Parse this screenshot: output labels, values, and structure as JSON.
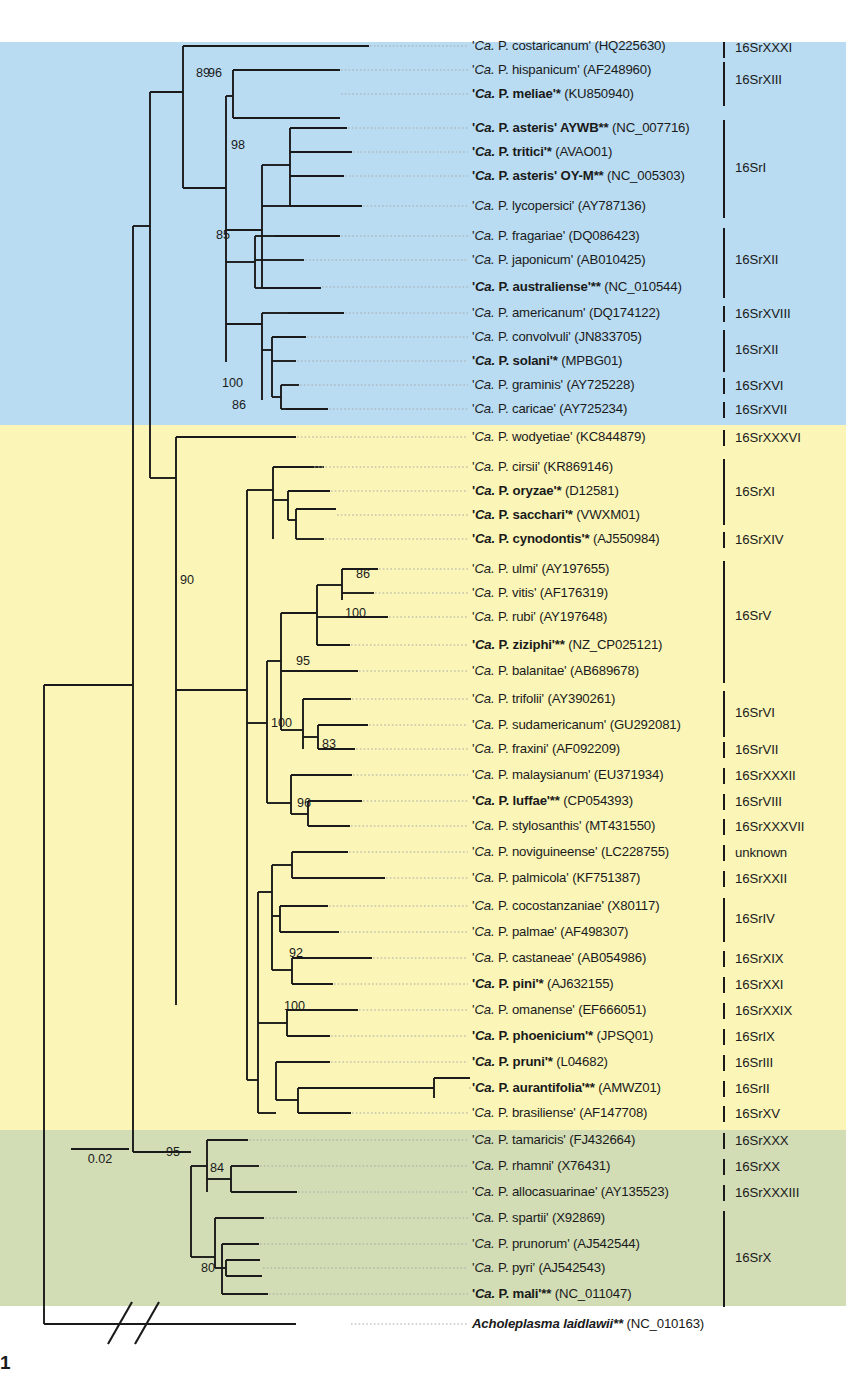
{
  "figure": {
    "number": "1",
    "scale_bar": {
      "value": "0.02",
      "label_position": "below"
    }
  },
  "clades": [
    {
      "name": "clade-blue",
      "color": "#b9dcf2",
      "top": 42,
      "height": 383
    },
    {
      "name": "clade-yellow",
      "color": "#fbf6b8",
      "top": 425,
      "height": 705
    },
    {
      "name": "clade-green",
      "color": "#d2ddb6",
      "top": 1130,
      "height": 176
    }
  ],
  "taxa": [
    {
      "name": "'Ca. P. costaricanum'",
      "accession": "(HQ225630)",
      "bold": false,
      "y": 46
    },
    {
      "name": "'Ca. P. hispanicum'",
      "accession": "(AF248960)",
      "bold": false,
      "y": 70
    },
    {
      "name": "'Ca. P. meliae'*",
      "accession": "(KU850940)",
      "bold": true,
      "y": 94
    },
    {
      "name": "'Ca. P. asteris' AYWB**",
      "accession": "(NC_007716)",
      "bold": true,
      "y": 128
    },
    {
      "name": "'Ca. P. tritici'*",
      "accession": "(AVAO01)",
      "bold": true,
      "y": 152
    },
    {
      "name": "'Ca. P. asteris' OY-M**",
      "accession": "(NC_005303)",
      "bold": true,
      "y": 176
    },
    {
      "name": "'Ca. P. lycopersici'",
      "accession": "(AY787136)",
      "bold": false,
      "y": 206
    },
    {
      "name": "'Ca. P. fragariae'",
      "accession": "(DQ086423)",
      "bold": false,
      "y": 236
    },
    {
      "name": "'Ca. P. japonicum'",
      "accession": "(AB010425)",
      "bold": false,
      "y": 260
    },
    {
      "name": "'Ca. P. australiense'**",
      "accession": "(NC_010544)",
      "bold": true,
      "y": 287
    },
    {
      "name": "'Ca. P. americanum'",
      "accession": "(DQ174122)",
      "bold": false,
      "y": 313
    },
    {
      "name": "'Ca. P. convolvuli'",
      "accession": "(JN833705)",
      "bold": false,
      "y": 337
    },
    {
      "name": "'Ca. P. solani'*",
      "accession": "(MPBG01)",
      "bold": true,
      "y": 361
    },
    {
      "name": "'Ca. P. graminis'",
      "accession": "(AY725228)",
      "bold": false,
      "y": 385
    },
    {
      "name": "'Ca. P. caricae'",
      "accession": "(AY725234)",
      "bold": false,
      "y": 409
    },
    {
      "name": "'Ca. P. wodyetiae'",
      "accession": "(KC844879)",
      "bold": false,
      "y": 437
    },
    {
      "name": "'Ca. P. cirsii'",
      "accession": "(KR869146)",
      "bold": false,
      "y": 467
    },
    {
      "name": "'Ca. P. oryzae'*",
      "accession": "(D12581)",
      "bold": true,
      "y": 491
    },
    {
      "name": "'Ca. P. sacchari'*",
      "accession": "(VWXM01)",
      "bold": true,
      "y": 515
    },
    {
      "name": "'Ca. P. cynodontis'*",
      "accession": "(AJ550984)",
      "bold": true,
      "y": 539
    },
    {
      "name": "'Ca. P. ulmi'",
      "accession": "(AY197655)",
      "bold": false,
      "y": 569
    },
    {
      "name": "'Ca. P. vitis'",
      "accession": "(AF176319)",
      "bold": false,
      "y": 593
    },
    {
      "name": "'Ca. P. rubi'",
      "accession": "(AY197648)",
      "bold": false,
      "y": 617
    },
    {
      "name": "'Ca. P. ziziphi'**",
      "accession": "(NZ_CP025121)",
      "bold": true,
      "y": 645
    },
    {
      "name": "'Ca. P. balanitae'",
      "accession": "(AB689678)",
      "bold": false,
      "y": 671
    },
    {
      "name": "'Ca. P. trifolii'",
      "accession": "(AY390261)",
      "bold": false,
      "y": 699
    },
    {
      "name": "'Ca. P. sudamericanum'",
      "accession": "(GU292081)",
      "bold": false,
      "y": 725
    },
    {
      "name": "'Ca. P. fraxini'",
      "accession": "(AF092209)",
      "bold": false,
      "y": 749
    },
    {
      "name": "'Ca. P. malaysianum'",
      "accession": "(EU371934)",
      "bold": false,
      "y": 775
    },
    {
      "name": "'Ca. P. luffae'**",
      "accession": "(CP054393)",
      "bold": true,
      "y": 801
    },
    {
      "name": "'Ca. P. stylosanthis'",
      "accession": "(MT431550)",
      "bold": false,
      "y": 826
    },
    {
      "name": "'Ca. P. noviguineense'",
      "accession": "(LC228755)",
      "bold": false,
      "y": 852
    },
    {
      "name": "'Ca. P. palmicola'",
      "accession": "(KF751387)",
      "bold": false,
      "y": 878
    },
    {
      "name": "'Ca. P. cocostanzaniae'",
      "accession": "(X80117)",
      "bold": false,
      "y": 906
    },
    {
      "name": "'Ca. P. palmae'",
      "accession": "(AF498307)",
      "bold": false,
      "y": 932
    },
    {
      "name": "'Ca. P. castaneae'",
      "accession": "(AB054986)",
      "bold": false,
      "y": 958
    },
    {
      "name": "'Ca. P. pini'*",
      "accession": "(AJ632155)",
      "bold": true,
      "y": 984
    },
    {
      "name": "'Ca. P. omanense'",
      "accession": "(EF666051)",
      "bold": false,
      "y": 1010
    },
    {
      "name": "'Ca. P. phoenicium'*",
      "accession": "(JPSQ01)",
      "bold": true,
      "y": 1036
    },
    {
      "name": "'Ca. P. pruni'*",
      "accession": "(L04682)",
      "bold": true,
      "y": 1062
    },
    {
      "name": "'Ca. P. aurantifolia'**",
      "accession": "(AMWZ01)",
      "bold": true,
      "y": 1088
    },
    {
      "name": "'Ca. P. brasiliense'",
      "accession": "(AF147708)",
      "bold": false,
      "y": 1113
    },
    {
      "name": "'Ca. P. tamaricis'",
      "accession": "(FJ432664)",
      "bold": false,
      "y": 1140
    },
    {
      "name": "'Ca. P. rhamni'",
      "accession": "(X76431)",
      "bold": false,
      "y": 1166
    },
    {
      "name": "'Ca. P. allocasuarinae'",
      "accession": "(AY135523)",
      "bold": false,
      "y": 1192
    },
    {
      "name": "'Ca. P. spartii'",
      "accession": "(X92869)",
      "bold": false,
      "y": 1218
    },
    {
      "name": "'Ca. P. prunorum'",
      "accession": "(AJ542544)",
      "bold": false,
      "y": 1244
    },
    {
      "name": "'Ca. P. pyri'",
      "accession": "(AJ542543)",
      "bold": false,
      "y": 1268
    },
    {
      "name": "'Ca. P. mali'**",
      "accession": "(NC_011047)",
      "bold": true,
      "y": 1294
    },
    {
      "name": "Acholeplasma laidlawii**",
      "accession": "(NC_010163)",
      "bold": true,
      "y": 1324,
      "outgroup": true
    }
  ],
  "groups": [
    {
      "label": "16SrXXXI",
      "bar_top": 42,
      "bar_height": 16,
      "label_y": 40
    },
    {
      "label": "16SrXIII",
      "bar_top": 62,
      "bar_height": 44,
      "label_y": 72
    },
    {
      "label": "16SrI",
      "bar_top": 120,
      "bar_height": 98,
      "label_y": 160
    },
    {
      "label": "16SrXII",
      "bar_top": 228,
      "bar_height": 70,
      "label_y": 252
    },
    {
      "label": "16SrXVIII",
      "bar_top": 306,
      "bar_height": 16,
      "label_y": 306
    },
    {
      "label": "16SrXII",
      "bar_top": 330,
      "bar_height": 42,
      "label_y": 342
    },
    {
      "label": "16SrXVI",
      "bar_top": 378,
      "bar_height": 16,
      "label_y": 378
    },
    {
      "label": "16SrXVII",
      "bar_top": 402,
      "bar_height": 16,
      "label_y": 402
    },
    {
      "label": "16SrXXXVI",
      "bar_top": 430,
      "bar_height": 16,
      "label_y": 430
    },
    {
      "label": "16SrXI",
      "bar_top": 459,
      "bar_height": 66,
      "label_y": 484
    },
    {
      "label": "16SrXIV",
      "bar_top": 532,
      "bar_height": 16,
      "label_y": 532
    },
    {
      "label": "16SrV",
      "bar_top": 561,
      "bar_height": 122,
      "label_y": 608
    },
    {
      "label": "16SrVI",
      "bar_top": 691,
      "bar_height": 46,
      "label_y": 705
    },
    {
      "label": "16SrVII",
      "bar_top": 742,
      "bar_height": 16,
      "label_y": 742
    },
    {
      "label": "16SrXXXII",
      "bar_top": 768,
      "bar_height": 16,
      "label_y": 768
    },
    {
      "label": "16SrVIII",
      "bar_top": 794,
      "bar_height": 16,
      "label_y": 794
    },
    {
      "label": "16SrXXXVII",
      "bar_top": 819,
      "bar_height": 16,
      "label_y": 819
    },
    {
      "label": "unknown",
      "bar_top": 845,
      "bar_height": 16,
      "label_y": 845
    },
    {
      "label": "16SrXXII",
      "bar_top": 871,
      "bar_height": 16,
      "label_y": 871
    },
    {
      "label": "16SrIV",
      "bar_top": 898,
      "bar_height": 44,
      "label_y": 911
    },
    {
      "label": "16SrXIX",
      "bar_top": 951,
      "bar_height": 16,
      "label_y": 951
    },
    {
      "label": "16SrXXI",
      "bar_top": 977,
      "bar_height": 16,
      "label_y": 977
    },
    {
      "label": "16SrXXIX",
      "bar_top": 1003,
      "bar_height": 16,
      "label_y": 1003
    },
    {
      "label": "16SrIX",
      "bar_top": 1029,
      "bar_height": 16,
      "label_y": 1029
    },
    {
      "label": "16SrIII",
      "bar_top": 1055,
      "bar_height": 16,
      "label_y": 1055
    },
    {
      "label": "16SrII",
      "bar_top": 1081,
      "bar_height": 16,
      "label_y": 1081
    },
    {
      "label": "16SrXV",
      "bar_top": 1106,
      "bar_height": 16,
      "label_y": 1106
    },
    {
      "label": "16SrXXX",
      "bar_top": 1133,
      "bar_height": 16,
      "label_y": 1133
    },
    {
      "label": "16SrXX",
      "bar_top": 1159,
      "bar_height": 16,
      "label_y": 1159
    },
    {
      "label": "16SrXXXIII",
      "bar_top": 1185,
      "bar_height": 16,
      "label_y": 1185
    },
    {
      "label": "16SrX",
      "bar_top": 1211,
      "bar_height": 96,
      "label_y": 1250
    }
  ],
  "bootstrap_values": [
    {
      "value": "89",
      "x": 196,
      "y": 73
    },
    {
      "value": "96",
      "x": 208,
      "y": 73
    },
    {
      "value": "98",
      "x": 231,
      "y": 145
    },
    {
      "value": "85",
      "x": 216,
      "y": 235
    },
    {
      "value": "100",
      "x": 222,
      "y": 383
    },
    {
      "value": "86",
      "x": 232,
      "y": 405
    },
    {
      "value": "90",
      "x": 180,
      "y": 580
    },
    {
      "value": "86",
      "x": 356,
      "y": 574
    },
    {
      "value": "100",
      "x": 345,
      "y": 613
    },
    {
      "value": "95",
      "x": 296,
      "y": 661
    },
    {
      "value": "100",
      "x": 271,
      "y": 723
    },
    {
      "value": "83",
      "x": 322,
      "y": 744
    },
    {
      "value": "96",
      "x": 297,
      "y": 803
    },
    {
      "value": "92",
      "x": 289,
      "y": 953
    },
    {
      "value": "100",
      "x": 284,
      "y": 1006
    },
    {
      "value": "95",
      "x": 166,
      "y": 1152
    },
    {
      "value": "84",
      "x": 210,
      "y": 1168
    },
    {
      "value": "80",
      "x": 201,
      "y": 1268
    }
  ],
  "tree": {
    "line_color": "#1a1a1a",
    "leader_color": "#9a9a9a",
    "branch_break_symbol": "//"
  }
}
